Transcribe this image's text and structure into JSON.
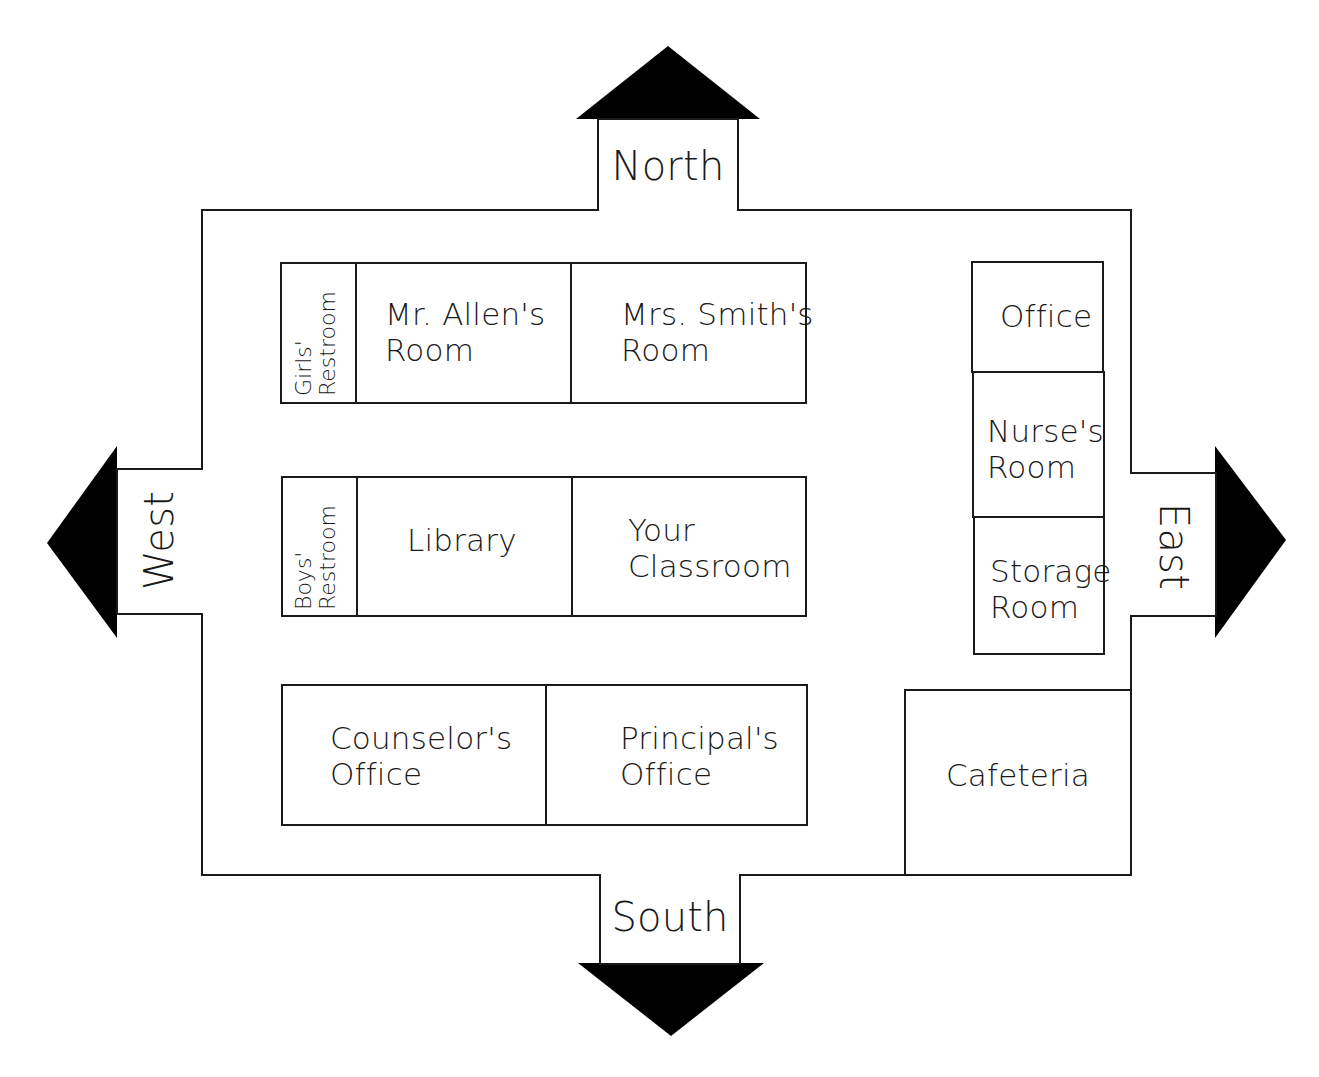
{
  "directions": {
    "north": "North",
    "south": "South",
    "east": "East",
    "west": "West"
  },
  "rooms": {
    "girls_restroom": "Girls'\nRestroom",
    "mr_allens_room": "Mr. Allen's\nRoom",
    "mrs_smiths_room": "Mrs. Smith's\nRoom",
    "boys_restroom": "Boys'\nRestroom",
    "library": "Library",
    "your_classroom": "Your\nClassroom",
    "counselors_office": "Counselor's\nOffice",
    "principals_office": "Principal's\nOffice",
    "office": "Office",
    "nurses_room": "Nurse's\nRoom",
    "storage_room": "Storage\nRoom",
    "cafeteria": "Cafeteria"
  },
  "colors": {
    "line": "#1a1a1a",
    "arrow": "#000000",
    "background": "#ffffff"
  }
}
